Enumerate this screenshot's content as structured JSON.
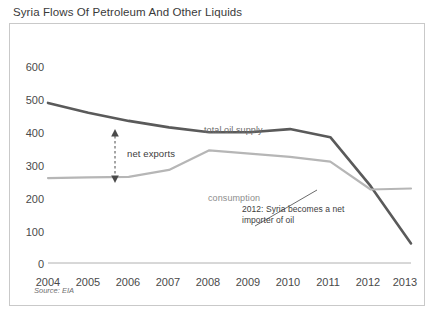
{
  "title": "Syria Flows Of Petroleum And Other Liquids",
  "subtitle": "thousand barrels per day",
  "source": "Source: EIA",
  "labels": {
    "total_oil_supply": "total oil supply",
    "consumption": "consumption",
    "net_exports": "net exports",
    "note_2012": "2012: Syria becomes a net\nimporter of oil"
  },
  "colors": {
    "total_oil_supply": "#5a5a5a",
    "consumption": "#b6b6b6",
    "axis": "#9a9a9a",
    "border": "#c9c9c9",
    "text": "#3a3a3a"
  },
  "chart_data": {
    "type": "line",
    "title": "Syria Flows Of Petroleum And Other Liquids",
    "subtitle": "thousand barrels per day",
    "xlabel": "",
    "ylabel": "thousand barrels per day",
    "ylim": [
      0,
      600
    ],
    "yticks": [
      0,
      100,
      200,
      300,
      400,
      500,
      600
    ],
    "ytick_labels": [
      "0",
      "100",
      "200",
      "300",
      "400",
      "500",
      "600"
    ],
    "grid": false,
    "legend": "inline-labels",
    "x": [
      2004,
      2005,
      2006,
      2007,
      2008,
      2009,
      2010,
      2011,
      2012,
      2013
    ],
    "categories": [
      "2004",
      "2005",
      "2006",
      "2007",
      "2008",
      "2009",
      "2010",
      "2011",
      "2012",
      "2013"
    ],
    "series": [
      {
        "name": "total oil supply",
        "color": "#5a5a5a",
        "values": [
          490,
          460,
          435,
          415,
          400,
          400,
          410,
          385,
          235,
          60
        ]
      },
      {
        "name": "consumption",
        "color": "#b6b6b6",
        "values": [
          260,
          262,
          264,
          285,
          345,
          335,
          325,
          310,
          225,
          228
        ]
      }
    ],
    "annotations": [
      {
        "text": "net exports",
        "type": "double-arrow",
        "x": 2006.4,
        "y_from": 265,
        "y_to": 432
      },
      {
        "text": "total oil supply",
        "type": "series-label",
        "x": 2008.6,
        "y": 455
      },
      {
        "text": "consumption",
        "type": "series-label",
        "x": 2008.5,
        "y": 250
      },
      {
        "text": "2012: Syria becomes a net importer of oil",
        "type": "callout",
        "x": 2011.0,
        "y": 120
      }
    ]
  }
}
